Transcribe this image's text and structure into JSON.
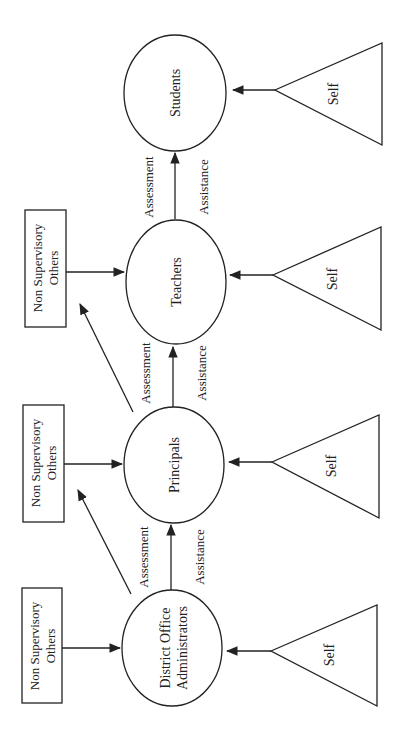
{
  "diagram": {
    "orientation": "rotated 90° counter-clockwise (text reads bottom-to-top)",
    "nodes": {
      "students": {
        "label": "Students"
      },
      "teachers": {
        "label": "Teachers"
      },
      "principals": {
        "label": "Principals"
      },
      "district": {
        "label_line1": "District Office",
        "label_line2": "Administrators"
      }
    },
    "non_supervisory": [
      {
        "line1": "Non Supervisory",
        "line2": "Others"
      },
      {
        "line1": "Non Supervisory",
        "line2": "Others"
      },
      {
        "line1": "Non Supervisory",
        "line2": "Others"
      }
    ],
    "self_sources": [
      {
        "label": "Self"
      },
      {
        "label": "Self"
      },
      {
        "label": "Self"
      },
      {
        "label": "Self"
      }
    ],
    "edge_labels": [
      {
        "top": "Assessment",
        "bottom": "Assistance"
      },
      {
        "top": "Assessment",
        "bottom": "Assistance"
      },
      {
        "top": "Assessment",
        "bottom": "Assistance"
      }
    ],
    "colors": {
      "line": "#222222",
      "background": "#ffffff"
    }
  }
}
